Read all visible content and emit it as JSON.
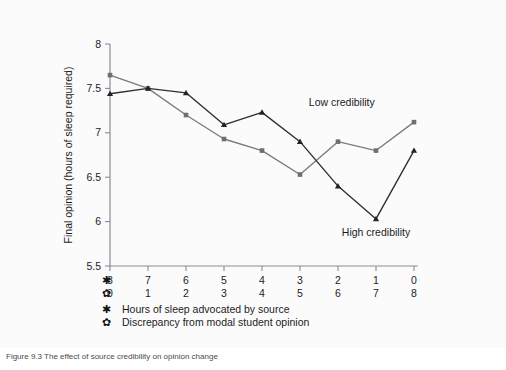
{
  "figure": {
    "background_color": "#fbfbfb",
    "caption": "Figure 9.3  The effect of source credibility on opinion change"
  },
  "chart_data": {
    "type": "line",
    "title": "",
    "xlabel": "",
    "ylabel": "Final opinion (hours of sleep required)",
    "ylim": [
      5.5,
      8
    ],
    "yticks": [
      "8",
      "7.5",
      "7",
      "6.5",
      "6",
      "5.5"
    ],
    "ytick_values": [
      8,
      7.5,
      7,
      6.5,
      6,
      5.5
    ],
    "grid": false,
    "legend_position": "inline-annotations",
    "x_axis_rows": [
      {
        "symbol": "✱",
        "symbol_name": "asterisk-symbol",
        "label": "Hours of sleep advocated by source",
        "ticks": [
          "8",
          "7",
          "6",
          "5",
          "4",
          "3",
          "2",
          "1",
          "0"
        ]
      },
      {
        "symbol": "✿",
        "symbol_name": "flower-symbol",
        "label": "Discrepancy from modal student opinion",
        "ticks": [
          "0",
          "1",
          "2",
          "3",
          "4",
          "5",
          "6",
          "7",
          "8"
        ]
      }
    ],
    "series": [
      {
        "name": "Low credibility",
        "marker": "square",
        "color": "#6f6f73",
        "values": [
          7.65,
          7.5,
          7.2,
          6.93,
          6.8,
          6.53,
          6.9,
          6.8,
          7.12
        ]
      },
      {
        "name": "High credibility",
        "marker": "triangle",
        "color": "#232327",
        "values": [
          7.44,
          7.5,
          7.45,
          7.09,
          7.23,
          6.9,
          6.4,
          6.03,
          6.8
        ]
      }
    ],
    "annotations": [
      {
        "text": "Low credibility",
        "x_index": 6.1,
        "y_value": 7.3
      },
      {
        "text": "High credibility",
        "x_index": 7.0,
        "y_value": 5.84
      }
    ]
  }
}
